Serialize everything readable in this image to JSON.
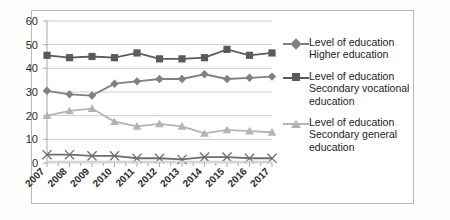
{
  "chart_data": {
    "type": "line",
    "title": "",
    "xlabel": "",
    "ylabel": "",
    "ylim": [
      0,
      60
    ],
    "yticks": [
      0,
      10,
      20,
      30,
      40,
      50,
      60
    ],
    "grid": true,
    "legend_position": "right",
    "categories": [
      "2007",
      "2008",
      "2009",
      "2010",
      "2011",
      "2012",
      "2013",
      "2014",
      "2015",
      "2016",
      "2017"
    ],
    "series": [
      {
        "name": "Level of education\nHigher education",
        "marker": "diamond",
        "color": "#808080",
        "values": [
          30.5,
          29.0,
          28.5,
          33.5,
          34.5,
          35.5,
          35.5,
          37.5,
          35.5,
          36.0,
          36.5
        ]
      },
      {
        "name": "Level of education\nSecondary vocational\neducation",
        "marker": "square",
        "color": "#5a5a5a",
        "values": [
          45.5,
          44.5,
          45.0,
          44.5,
          46.5,
          44.0,
          44.0,
          44.5,
          48.0,
          45.5,
          46.5
        ]
      },
      {
        "name": "Level of education\nSecondary general\neducation",
        "marker": "triangle",
        "color": "#b3b3b3",
        "values": [
          20.0,
          22.0,
          23.0,
          17.5,
          15.5,
          16.5,
          15.5,
          12.5,
          14.0,
          13.5,
          13.0
        ]
      },
      {
        "name": "",
        "marker": "x",
        "color": "#6e6e6e",
        "in_legend": false,
        "values": [
          3.5,
          3.5,
          3.0,
          3.0,
          2.0,
          2.0,
          1.5,
          2.5,
          2.5,
          2.0,
          2.0
        ]
      },
      {
        "name": "",
        "marker": "none",
        "color": "#cfcfcf",
        "in_legend": false,
        "values": [
          0.6,
          0.6,
          0.6,
          0.6,
          0.6,
          0.6,
          0.6,
          0.6,
          0.6,
          0.6,
          0.6
        ]
      }
    ]
  },
  "legend": {
    "entries": [
      {
        "label": "Level of education\nHigher education",
        "marker": "diamond",
        "color": "#808080"
      },
      {
        "label": "Level of education\nSecondary vocational\neducation",
        "marker": "square",
        "color": "#5a5a5a"
      },
      {
        "label": "Level of education\nSecondary general\neducation",
        "marker": "triangle",
        "color": "#b3b3b3"
      }
    ]
  },
  "colors": {
    "gridline": "#c8c8c8",
    "axis": "#9e9e9e",
    "frame": "#b9b9b9",
    "text": "#1c1c1c",
    "background": "#ffffff"
  }
}
